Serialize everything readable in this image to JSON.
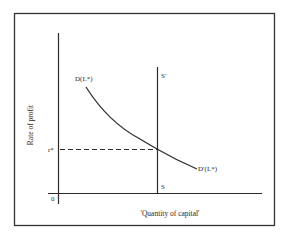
{
  "diagram": {
    "title": "",
    "y_axis_label": "Rate of profit",
    "x_axis_label": "'Quantity of capital'",
    "origin_label": "0",
    "equilibrium_rate_label": "r*",
    "demand_curve_top_label": "D(L*)",
    "demand_curve_bottom_label": "D′(L*)",
    "supply_top_label": "S′",
    "supply_bottom_label": "S",
    "colors": {
      "line": "#2a2a2a",
      "background": "#ffffff"
    }
  }
}
